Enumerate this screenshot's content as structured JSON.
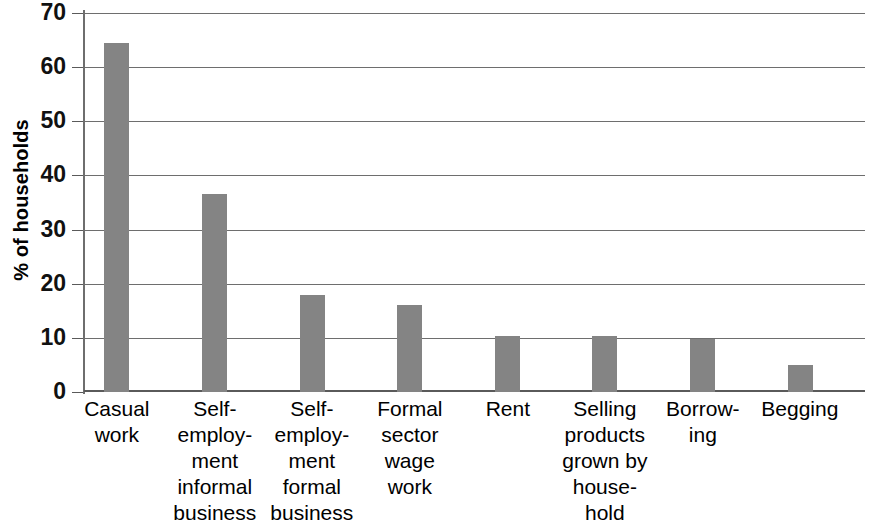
{
  "chart_data": {
    "type": "bar",
    "title": "",
    "subtitle": "",
    "xlabel": "",
    "ylabel": "% of households",
    "ylim": [
      0,
      70
    ],
    "yticks": [
      0,
      10,
      20,
      30,
      40,
      50,
      60,
      70
    ],
    "ytick_labels": [
      "0",
      "10",
      "20",
      "30",
      "40",
      "50",
      "60",
      "70"
    ],
    "grid": true,
    "legend": false,
    "legend_position": "none",
    "bar_color": "#848484",
    "axis_color": "#6e6e6e",
    "categories": [
      "Casual\nwork",
      "Self-\nemploy-\nment\ninformal\nbusiness",
      "Self-\nemploy-\nment\nformal\nbusiness",
      "Formal\nsector\nwage\nwork",
      "Rent",
      "Selling\nproducts\ngrown by\nhouse-\nhold",
      "Borrow-\ning",
      "Begging"
    ],
    "values": [
      64.5,
      36.5,
      17.9,
      16.0,
      10.4,
      10.4,
      9.7,
      5.0
    ]
  }
}
